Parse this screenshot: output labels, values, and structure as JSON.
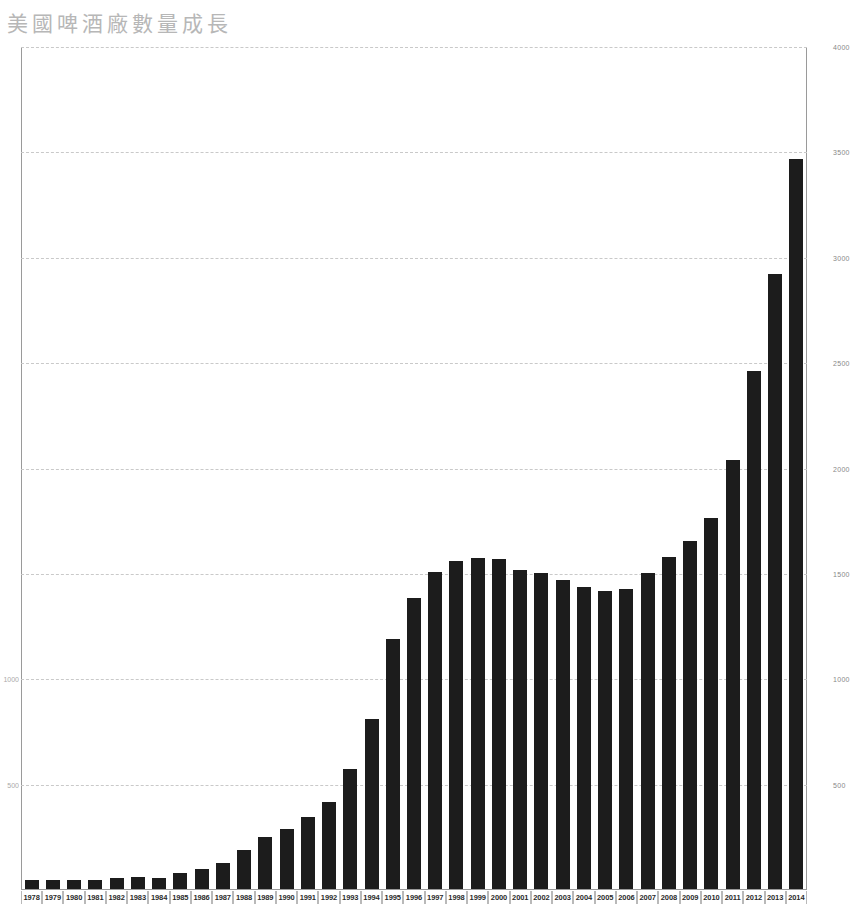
{
  "chart_data": {
    "type": "bar",
    "title": "美國啤酒廠數量成長",
    "xlabel": "",
    "ylabel": "",
    "ylim": [
      0,
      4000
    ],
    "grid": true,
    "legend": null,
    "yticks": [
      0,
      500,
      1000,
      1500,
      2000,
      2500,
      3000,
      3500,
      4000
    ],
    "ytick_labels": [
      "0",
      "500",
      "1000",
      "1500",
      "2000",
      "2500",
      "3000",
      "3500",
      "4000"
    ],
    "ytick_labels_visible": [
      "500",
      "1000",
      "1500",
      "2000",
      "2500",
      "3000",
      "3500",
      "4000"
    ],
    "bar_color": "#1c1c1c",
    "title_color": "#b7b7b7",
    "grid_color": "#c9c9c9",
    "axis_color": "#9a9a9a",
    "categories": [
      "1978",
      "1979",
      "1980",
      "1981",
      "1982",
      "1983",
      "1984",
      "1985",
      "1986",
      "1987",
      "1988",
      "1989",
      "1990",
      "1991",
      "1992",
      "1993",
      "1994",
      "1995",
      "1996",
      "1997",
      "1998",
      "1999",
      "2000",
      "2001",
      "2002",
      "2003",
      "2004",
      "2005",
      "2006",
      "2007",
      "2008",
      "2009",
      "2010",
      "2011",
      "2012",
      "2013",
      "2014"
    ],
    "values": [
      42,
      44,
      44,
      45,
      52,
      55,
      54,
      76,
      96,
      124,
      185,
      245,
      284,
      341,
      412,
      571,
      806,
      1187,
      1381,
      1506,
      1556,
      1573,
      1566,
      1514,
      1500,
      1467,
      1434,
      1416,
      1425,
      1500,
      1574,
      1653,
      1759,
      2036,
      2456,
      2917,
      3464
    ]
  }
}
